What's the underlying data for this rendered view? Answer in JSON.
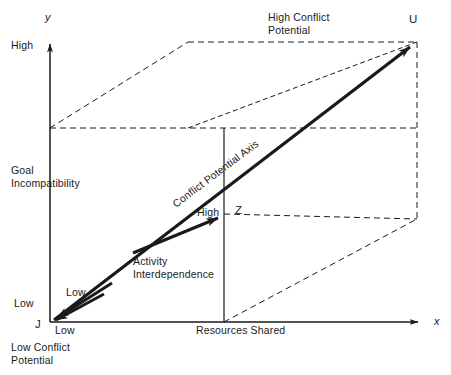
{
  "figure": {
    "type": "3d-axes-diagram",
    "background_color": "#ffffff",
    "line_color": "#1a1a1a"
  },
  "axes": {
    "y_axis": {
      "variable_label": "y",
      "name_label": "Goal\nIncompatibility",
      "high_tick": "High",
      "low_tick": "Low"
    },
    "x_axis": {
      "variable_label": "x",
      "name_label": "Resources Shared",
      "low_tick": "Low"
    },
    "z_axis": {
      "name_label": "Activity\nInterdependence",
      "high_tick": "High",
      "low_tick": "Low"
    },
    "main_axis": {
      "name_label": "Conflict Potential Axis"
    }
  },
  "corners": {
    "origin": {
      "key": "J",
      "annotation": "Low Conflict\nPotential"
    },
    "far": {
      "key": "U",
      "annotation": "High Conflict\nPotential"
    },
    "depth": {
      "key": "Z"
    }
  },
  "geometry": {
    "origin": [
      50,
      322
    ],
    "y_high": [
      50,
      128
    ],
    "x_end": [
      417,
      322
    ],
    "z_far": [
      224,
      214
    ],
    "u_corner": [
      417,
      42
    ],
    "back_top_left": [
      188,
      42
    ],
    "back_bottom_right": [
      417,
      219
    ],
    "x_arrow_tip": [
      427,
      322
    ],
    "y_arrow_tip": [
      50,
      36
    ]
  }
}
